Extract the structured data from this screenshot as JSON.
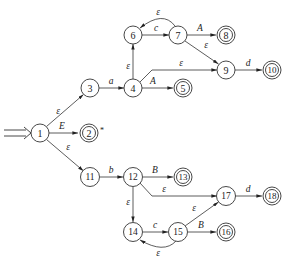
{
  "diagram": {
    "type": "NFA",
    "start_state": "1",
    "start_marker": "⇒",
    "nodes": [
      {
        "id": "1",
        "label": "1",
        "x": 40,
        "y": 133,
        "accepting": false
      },
      {
        "id": "2",
        "label": "2",
        "x": 89,
        "y": 133,
        "accepting": true,
        "note": "*"
      },
      {
        "id": "3",
        "label": "3",
        "x": 90,
        "y": 88,
        "accepting": false
      },
      {
        "id": "4",
        "label": "4",
        "x": 133,
        "y": 88,
        "accepting": false
      },
      {
        "id": "5",
        "label": "5",
        "x": 183,
        "y": 88,
        "accepting": true
      },
      {
        "id": "6",
        "label": "6",
        "x": 133,
        "y": 35,
        "accepting": false
      },
      {
        "id": "7",
        "label": "7",
        "x": 178,
        "y": 35,
        "accepting": false
      },
      {
        "id": "8",
        "label": "8",
        "x": 226,
        "y": 35,
        "accepting": true
      },
      {
        "id": "9",
        "label": "9",
        "x": 226,
        "y": 70,
        "accepting": false
      },
      {
        "id": "10",
        "label": "10",
        "x": 272,
        "y": 70,
        "accepting": true
      },
      {
        "id": "11",
        "label": "11",
        "x": 90,
        "y": 177,
        "accepting": false
      },
      {
        "id": "12",
        "label": "12",
        "x": 133,
        "y": 177,
        "accepting": false
      },
      {
        "id": "13",
        "label": "13",
        "x": 183,
        "y": 177,
        "accepting": true
      },
      {
        "id": "14",
        "label": "14",
        "x": 133,
        "y": 232,
        "accepting": false
      },
      {
        "id": "15",
        "label": "15",
        "x": 178,
        "y": 232,
        "accepting": false
      },
      {
        "id": "16",
        "label": "16",
        "x": 226,
        "y": 232,
        "accepting": true
      },
      {
        "id": "17",
        "label": "17",
        "x": 226,
        "y": 196,
        "accepting": false
      },
      {
        "id": "18",
        "label": "18",
        "x": 272,
        "y": 196,
        "accepting": true
      }
    ],
    "edges": [
      {
        "from": "1",
        "to": "3",
        "label": "ε"
      },
      {
        "from": "1",
        "to": "2",
        "label": "E"
      },
      {
        "from": "1",
        "to": "11",
        "label": "ε"
      },
      {
        "from": "3",
        "to": "4",
        "label": "a"
      },
      {
        "from": "4",
        "to": "5",
        "label": "A"
      },
      {
        "from": "4",
        "to": "6",
        "label": "ε"
      },
      {
        "from": "4",
        "to": "9",
        "label": "ε"
      },
      {
        "from": "6",
        "to": "7",
        "label": "c"
      },
      {
        "from": "7",
        "to": "6",
        "label": "ε"
      },
      {
        "from": "7",
        "to": "8",
        "label": "A"
      },
      {
        "from": "7",
        "to": "9",
        "label": "ε"
      },
      {
        "from": "9",
        "to": "10",
        "label": "d"
      },
      {
        "from": "11",
        "to": "12",
        "label": "b"
      },
      {
        "from": "12",
        "to": "13",
        "label": "B"
      },
      {
        "from": "12",
        "to": "17",
        "label": "ε"
      },
      {
        "from": "12",
        "to": "14",
        "label": "ε"
      },
      {
        "from": "14",
        "to": "15",
        "label": "c"
      },
      {
        "from": "15",
        "to": "14",
        "label": "ε"
      },
      {
        "from": "15",
        "to": "16",
        "label": "B"
      },
      {
        "from": "15",
        "to": "17",
        "label": "ε"
      },
      {
        "from": "17",
        "to": "18",
        "label": "d"
      }
    ]
  },
  "labels": {
    "n1": "1",
    "n2": "2",
    "n3": "3",
    "n4": "4",
    "n5": "5",
    "n6": "6",
    "n7": "7",
    "n8": "8",
    "n9": "9",
    "n10": "10",
    "n11": "11",
    "n12": "12",
    "n13": "13",
    "n14": "14",
    "n15": "15",
    "n16": "16",
    "n17": "17",
    "n18": "18",
    "star": "*",
    "e_1_3": "ε",
    "e_1_2": "E",
    "e_1_11": "ε",
    "e_3_4": "a",
    "e_4_5": "A",
    "e_4_6": "ε",
    "e_4_9": "ε",
    "e_6_7": "c",
    "e_7_6": "ε",
    "e_7_8": "A",
    "e_7_9": "ε",
    "e_9_10": "d",
    "e_11_12": "b",
    "e_12_13": "B",
    "e_12_17": "ε",
    "e_12_14": "ε",
    "e_14_15": "c",
    "e_15_14": "ε",
    "e_15_16": "B",
    "e_15_17": "ε",
    "e_17_18": "d"
  }
}
